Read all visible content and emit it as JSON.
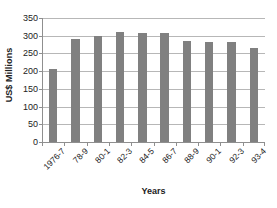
{
  "chart_data": {
    "type": "bar",
    "title": "",
    "xlabel": "Years",
    "ylabel": "US$ Millions",
    "categories": [
      "1976-7",
      "78-9",
      "80-1",
      "82-3",
      "84-5",
      "86-7",
      "88-9",
      "90-1",
      "92-3",
      "93-4"
    ],
    "values": [
      205,
      292,
      300,
      310,
      308,
      307,
      285,
      283,
      281,
      264
    ],
    "series": [
      {
        "name": "US$ Millions",
        "values": [
          205,
          292,
          300,
          310,
          308,
          307,
          285,
          283,
          281,
          264
        ]
      }
    ],
    "ylim": [
      0,
      350
    ],
    "ytick_step": 50,
    "yticks": [
      0,
      50,
      100,
      150,
      200,
      250,
      300,
      350
    ],
    "ytick_labels": [
      "0",
      "50",
      "100",
      "150",
      "200",
      "250",
      "300",
      "350"
    ],
    "grid": true,
    "grid_axis": "y",
    "legend": false,
    "legend_position": "none",
    "bar_color": "#808080",
    "gridline_color": "#b7b7b7",
    "axis_color": "#8f8f8f",
    "text_color": "#222222",
    "background_color": "#ffffff",
    "xtick_label_rotation": -45
  }
}
